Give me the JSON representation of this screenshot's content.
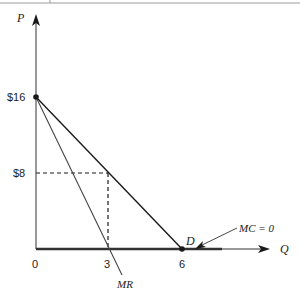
{
  "diagram": {
    "type": "monopoly-demand-marginal-revenue",
    "axes": {
      "y_label": "P",
      "x_label": "Q"
    },
    "y_ticks": [
      {
        "label": "$16",
        "value": 16
      },
      {
        "label": "$8",
        "value": 8
      }
    ],
    "x_ticks": [
      {
        "label": "0",
        "value": 0
      },
      {
        "label": "3",
        "value": 3
      },
      {
        "label": "6",
        "value": 6
      }
    ],
    "curves": {
      "demand": {
        "label": "D",
        "from": [
          0,
          16
        ],
        "to": [
          6,
          0
        ]
      },
      "marginal_revenue": {
        "label": "MR",
        "from": [
          0,
          16
        ],
        "to": [
          3,
          0
        ]
      },
      "marginal_cost": {
        "label": "MC = 0",
        "value": 0
      }
    },
    "profit_max_point": {
      "Q": 3,
      "P": 8
    },
    "colors": {
      "line": "#1a1a1a",
      "mr_line": "#444444",
      "axis": "#333333",
      "top_rule": "#9a9a9a"
    }
  }
}
